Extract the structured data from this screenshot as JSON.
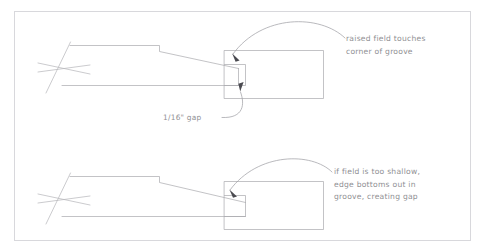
{
  "page": {
    "background_color": "#ffffff",
    "line_color": "#a9a9ae",
    "frame_color": "#d8d8dc",
    "text_color": "#8f8f93",
    "arrow_color": "#4a4a50",
    "width": 484,
    "height": 252
  },
  "frame": {
    "label": "drawing-border"
  },
  "annotations": {
    "top_right": {
      "line1": "raised field touches",
      "line2": "corner of groove"
    },
    "top_gap": {
      "line1": "1/16\" gap"
    },
    "bottom_right": {
      "line1": "if field is too shallow,",
      "line2": "edge bottoms out in",
      "line3": "groove, creating gap"
    }
  },
  "figures": [
    {
      "name": "correct-fit-detail",
      "caption": "raised field touches corner of groove",
      "parts": [
        "raised-panel-profile",
        "break-line",
        "stile-with-groove",
        "leader-arrow",
        "gap-leader-arrow"
      ]
    },
    {
      "name": "shallow-field-detail",
      "caption": "if field is too shallow, edge bottoms out in groove, creating gap",
      "parts": [
        "raised-panel-profile",
        "break-line",
        "stile-with-groove",
        "leader-arrow"
      ]
    }
  ]
}
